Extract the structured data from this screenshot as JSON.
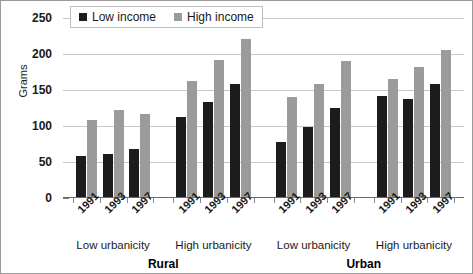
{
  "chart_data": {
    "type": "bar",
    "title": "",
    "xlabel": "",
    "ylabel": "Grams",
    "ylim": [
      0,
      250
    ],
    "yticks": [
      0,
      50,
      100,
      150,
      200,
      250
    ],
    "grid": true,
    "legend_position": "top-left",
    "legend": [
      "Low income",
      "High income"
    ],
    "categories": [
      "1991",
      "1993",
      "1997",
      "1991",
      "1993",
      "1997",
      "1991",
      "1993",
      "1997",
      "1991",
      "1993",
      "1997"
    ],
    "group_labels": [
      "Low urbanicity",
      "High urbanicity",
      "Low urbanicity",
      "High urbanicity"
    ],
    "supergroup_labels": [
      "Rural",
      "Urban"
    ],
    "series": [
      {
        "name": "Low income",
        "color": "#1c1c1c",
        "values": [
          58,
          61,
          68,
          112,
          133,
          159,
          78,
          98,
          125,
          142,
          137,
          158
        ]
      },
      {
        "name": "High income",
        "color": "#9b9b9b",
        "values": [
          109,
          122,
          116,
          163,
          191,
          221,
          140,
          159,
          190,
          165,
          182,
          205
        ]
      }
    ],
    "points": [
      {
        "region": "Rural",
        "urbanicity": "Low urbanicity",
        "year": "1991",
        "low_income": 58,
        "high_income": 109
      },
      {
        "region": "Rural",
        "urbanicity": "Low urbanicity",
        "year": "1993",
        "low_income": 61,
        "high_income": 122
      },
      {
        "region": "Rural",
        "urbanicity": "Low urbanicity",
        "year": "1997",
        "low_income": 68,
        "high_income": 116
      },
      {
        "region": "Rural",
        "urbanicity": "High urbanicity",
        "year": "1991",
        "low_income": 112,
        "high_income": 163
      },
      {
        "region": "Rural",
        "urbanicity": "High urbanicity",
        "year": "1993",
        "low_income": 133,
        "high_income": 191
      },
      {
        "region": "Rural",
        "urbanicity": "High urbanicity",
        "year": "1997",
        "low_income": 159,
        "high_income": 221
      },
      {
        "region": "Urban",
        "urbanicity": "Low urbanicity",
        "year": "1991",
        "low_income": 78,
        "high_income": 140
      },
      {
        "region": "Urban",
        "urbanicity": "Low urbanicity",
        "year": "1993",
        "low_income": 98,
        "high_income": 159
      },
      {
        "region": "Urban",
        "urbanicity": "Low urbanicity",
        "year": "1997",
        "low_income": 125,
        "high_income": 190
      },
      {
        "region": "Urban",
        "urbanicity": "High urbanicity",
        "year": "1991",
        "low_income": 142,
        "high_income": 165
      },
      {
        "region": "Urban",
        "urbanicity": "High urbanicity",
        "year": "1993",
        "low_income": 137,
        "high_income": 182
      },
      {
        "region": "Urban",
        "urbanicity": "High urbanicity",
        "year": "1997",
        "low_income": 158,
        "high_income": 205
      }
    ]
  },
  "axis": {
    "y_title": "Grams",
    "y_tick_labels": [
      "250",
      "200",
      "150",
      "100",
      "50",
      "0"
    ]
  },
  "legend": {
    "items": [
      {
        "label": "Low income",
        "swatch": "low",
        "color": "#1c1c1c"
      },
      {
        "label": "High income",
        "swatch": "high",
        "color": "#9b9b9b"
      }
    ]
  },
  "groups": [
    {
      "region": "Rural",
      "urbanicity": "Low urbanicity",
      "years": [
        "1991",
        "1993",
        "1997"
      ]
    },
    {
      "region": "Rural",
      "urbanicity": "High urbanicity",
      "years": [
        "1991",
        "1993",
        "1997"
      ]
    },
    {
      "region": "Urban",
      "urbanicity": "Low urbanicity",
      "years": [
        "1991",
        "1993",
        "1997"
      ]
    },
    {
      "region": "Urban",
      "urbanicity": "High urbanicity",
      "years": [
        "1991",
        "1993",
        "1997"
      ]
    }
  ]
}
